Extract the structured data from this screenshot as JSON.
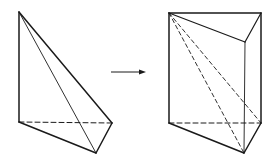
{
  "diagram": {
    "title": "",
    "colors": {
      "stroke": "#1a1a1a",
      "background": "#ffffff"
    },
    "left_figure": {
      "name": "tetrahedron",
      "vertices": {
        "apex": [
          19,
          12
        ],
        "base_left": [
          19,
          122
        ],
        "base_right": [
          112,
          123
        ],
        "base_front": [
          96,
          153
        ]
      }
    },
    "arrow": {
      "from": [
        111,
        72
      ],
      "to": [
        146,
        72
      ]
    },
    "right_figure": {
      "name": "triangular-prism",
      "vertices": {
        "top_left": [
          169,
          13
        ],
        "top_right": [
          261,
          13
        ],
        "top_front": [
          245,
          42
        ],
        "bottom_left": [
          169,
          123
        ],
        "bottom_right": [
          261,
          123
        ],
        "bottom_front": [
          244,
          153
        ]
      }
    }
  }
}
